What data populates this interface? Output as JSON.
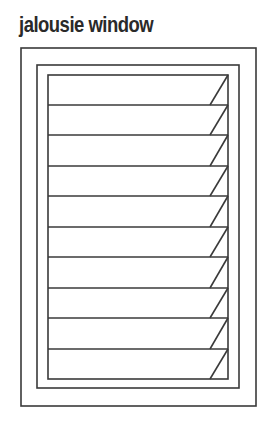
{
  "title": "jalousie window",
  "colors": {
    "line": "#3a3a3a",
    "text": "#2a2a2a",
    "background": "#ffffff"
  },
  "diagram": {
    "type": "jalousie window line illustration",
    "frames": [
      {
        "name": "outer-frame",
        "x": 21,
        "y": 48,
        "w": 235,
        "h": 358
      },
      {
        "name": "middle-frame",
        "x": 37,
        "y": 65,
        "w": 202,
        "h": 323
      },
      {
        "name": "inner-frame",
        "x": 48,
        "y": 75,
        "w": 180,
        "h": 304
      }
    ],
    "louver_count": 10,
    "louver_line_y": [
      75,
      105,
      135,
      166,
      196,
      227,
      257,
      288,
      318,
      349,
      379
    ],
    "louver_diagonal": {
      "top_x": 228,
      "bottom_x": 210
    }
  }
}
